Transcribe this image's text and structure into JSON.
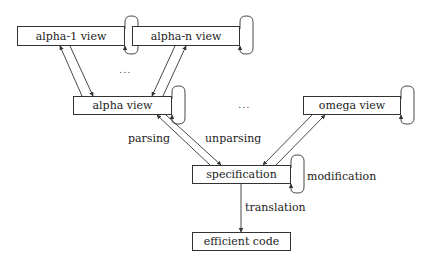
{
  "nodes": {
    "alpha1": {
      "label": "alpha-1 view"
    },
    "alphan": {
      "label": "alpha-n view"
    },
    "alpha": {
      "label": "alpha view"
    },
    "omega": {
      "label": "omega view"
    },
    "spec": {
      "label": "specification"
    },
    "code": {
      "label": "efficient code"
    }
  },
  "edges": {
    "parsing": "parsing",
    "unparsing": "unparsing",
    "modification": "modification",
    "translation": "translation"
  },
  "ellipsis": {
    "top": "...",
    "middle": "..."
  },
  "colors": {
    "line": "#333333",
    "background": "#ffffff"
  }
}
